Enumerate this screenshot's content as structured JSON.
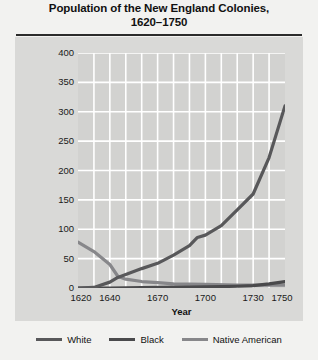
{
  "chart_data": {
    "type": "line",
    "title": "Population of the New England Colonies, 1620–1750",
    "title_lines": [
      "Population of the New England Colonies,",
      "1620–1750"
    ],
    "xlabel": "Year",
    "ylabel": "Population (in thousands)",
    "xlim": [
      1620,
      1750
    ],
    "ylim": [
      0,
      400
    ],
    "ytick_values": [
      0,
      50,
      100,
      150,
      200,
      250,
      300,
      350,
      400
    ],
    "ytick_labels": [
      "0",
      "50",
      "100",
      "150",
      "200",
      "250",
      "300",
      "350",
      "400"
    ],
    "xtick_values": [
      1620,
      1640,
      1670,
      1700,
      1730,
      1750
    ],
    "xtick_labels": [
      "1620",
      "1640",
      "1670",
      "1700",
      "1730",
      "1750"
    ],
    "grid": true,
    "grid_color": "#ffffff",
    "plot_background": "#d2d2d0",
    "panel_background": "#d9d9d7",
    "legend_position": "below",
    "series": [
      {
        "name": "White",
        "color": "#58585a",
        "x": [
          1620,
          1630,
          1640,
          1645,
          1650,
          1660,
          1670,
          1680,
          1690,
          1695,
          1700,
          1710,
          1720,
          1730,
          1740,
          1750
        ],
        "values": [
          0,
          1,
          10,
          18,
          23,
          33,
          42,
          56,
          72,
          86,
          90,
          106,
          133,
          160,
          222,
          310
        ]
      },
      {
        "name": "Black",
        "color": "#4a4a4c",
        "x": [
          1620,
          1640,
          1670,
          1700,
          1720,
          1730,
          1740,
          1750
        ],
        "values": [
          0,
          0,
          1,
          2,
          3,
          4,
          7,
          11
        ]
      },
      {
        "name": "Native American",
        "color": "#87878a",
        "x": [
          1620,
          1630,
          1640,
          1645,
          1650,
          1660,
          1670,
          1680,
          1700,
          1720,
          1750
        ],
        "values": [
          78,
          62,
          40,
          20,
          15,
          11,
          9,
          7,
          6,
          5,
          5
        ]
      }
    ]
  },
  "legend": {
    "items": [
      {
        "label": "White",
        "color": "#58585a"
      },
      {
        "label": "Black",
        "color": "#4a4a4c"
      },
      {
        "label": "Native American",
        "color": "#87878a"
      }
    ]
  }
}
